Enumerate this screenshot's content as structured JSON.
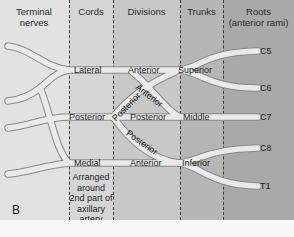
{
  "figure": {
    "panel_letter": "B",
    "colors": {
      "col_terminal": "#e2e2e2",
      "col_cords": "#d5d5d5",
      "col_divisions": "#c6c6c6",
      "col_trunks": "#b4b4b4",
      "col_roots": "#a6a6a6",
      "nerve_fill": "#e9e9e9",
      "nerve_stroke": "#8a8a8a"
    }
  },
  "headers": {
    "terminal": "Terminal nerves",
    "cords": "Cords",
    "divisions": "Divisions",
    "trunks": "Trunks",
    "roots_line1": "Roots",
    "roots_line2": "(anterior rami)"
  },
  "roots": [
    "C5",
    "C6",
    "C7",
    "C8",
    "T1"
  ],
  "trunks": [
    "Superior",
    "Middle",
    "Inferior"
  ],
  "divisions": {
    "superior_anterior": "Anterior",
    "superior_posterior": "Posterior",
    "middle_anterior": "Anterior",
    "middle_posterior": "Posterior",
    "inferior_anterior": "Anterior",
    "inferior_posterior": "Posterior"
  },
  "cords": [
    "Lateral",
    "Posterior",
    "Medial"
  ],
  "cords_note": [
    "Arranged",
    "around",
    "2nd part of",
    "axillary",
    "artery"
  ]
}
